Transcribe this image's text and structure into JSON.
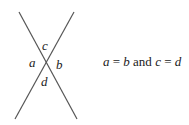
{
  "diagram": {
    "lines": [
      {
        "name": "line-1",
        "x1": 19,
        "y1": 12,
        "x2": 77,
        "y2": 119
      },
      {
        "name": "line-2",
        "x1": 74,
        "y1": 12,
        "x2": 15,
        "y2": 119
      }
    ],
    "line_color": "#555555",
    "angle_labels": {
      "top": "c",
      "left": "a",
      "right": "b",
      "bottom": "d"
    },
    "equation": {
      "var1": "a",
      "eq1": " = ",
      "var2": "b",
      "conj": " and ",
      "var3": "c",
      "eq2": " = ",
      "var4": "d"
    }
  }
}
